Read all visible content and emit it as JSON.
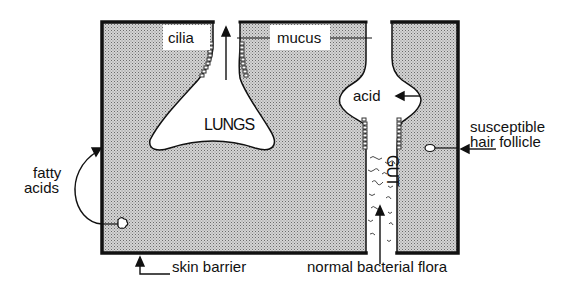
{
  "diagram": {
    "labels": {
      "cilia": "cilia",
      "mucus": "mucus",
      "lungs": "LUNGS",
      "acid": "acid",
      "gut": "GUT",
      "hair_follicle_line1": "susceptible",
      "hair_follicle_line2": "hair follicle",
      "fatty_acids_line1": "fatty",
      "fatty_acids_line2": "acids",
      "skin_barrier": "skin barrier",
      "normal_flora": "normal bacterial flora"
    },
    "colors": {
      "outline": "#111111",
      "stipple_fill": "#bdbdbd",
      "background": "#ffffff"
    }
  }
}
